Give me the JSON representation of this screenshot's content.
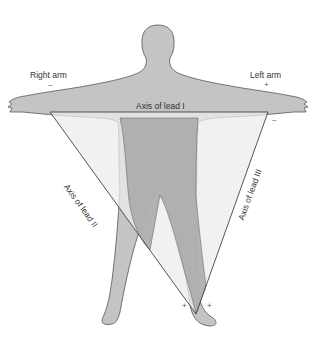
{
  "diagram": {
    "labels": {
      "right_arm": "Right arm",
      "left_arm": "Left arm",
      "lead_1": "Axis of lead I",
      "lead_2": "Axis of lead II",
      "lead_3": "Axis of lead III"
    },
    "signs": {
      "right_arm": "–",
      "left_arm_top": "+",
      "left_arm_bottom": "–",
      "left_leg_1": "+",
      "left_leg_2": "+"
    },
    "colors": {
      "body": "#c4c4c4",
      "body_outline": "#555555",
      "triangle_fill": "#e8e8e8",
      "overlap_fill": "#a8a8a8",
      "line": "#444444"
    }
  }
}
